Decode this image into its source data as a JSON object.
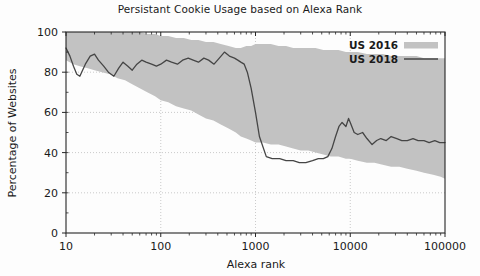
{
  "figure": {
    "width": 480,
    "height": 276,
    "background": "#fdfdfd"
  },
  "chart_data": {
    "type": "area",
    "title": "Persistant Cookie Usage based on Alexa Rank",
    "xlabel": "Alexa rank",
    "ylabel": "Percentage of Websites",
    "xscale": "log",
    "yscale": "linear",
    "xlim": [
      10,
      100000
    ],
    "ylim": [
      0,
      100
    ],
    "xticks": [
      10,
      100,
      1000,
      10000,
      100000
    ],
    "xticklabels": [
      "10",
      "100",
      "1000",
      "10000",
      "100000"
    ],
    "yticks": [
      0,
      20,
      40,
      60,
      80,
      100
    ],
    "yticklabels": [
      "0",
      "20",
      "40",
      "60",
      "80",
      "100"
    ],
    "grid": true,
    "grid_style": "dotted",
    "legend_position": "upper right",
    "colors": {
      "band_fill": "#c2c2c2",
      "line": "#454545",
      "axis": "#262626",
      "text": "#1a1a1a"
    },
    "series": [
      {
        "name": "US 2016",
        "render": "band",
        "fill": "#c2c2c2",
        "x": [
          10,
          12,
          14,
          17,
          20,
          24,
          29,
          35,
          42,
          50,
          60,
          72,
          87,
          100,
          120,
          145,
          175,
          210,
          250,
          300,
          360,
          430,
          520,
          620,
          700,
          800,
          900,
          1000,
          1200,
          1450,
          1750,
          2100,
          2500,
          3000,
          3600,
          4300,
          5200,
          6200,
          7500,
          9000,
          10000,
          12000,
          15000,
          18000,
          22000,
          27000,
          33000,
          40000,
          50000,
          60000,
          75000,
          90000,
          100000
        ],
        "y_upper": [
          100,
          100,
          100,
          100,
          100,
          100,
          100,
          100,
          100,
          100,
          100,
          99,
          99,
          98,
          98,
          97,
          97,
          96,
          96,
          95,
          95,
          94,
          93,
          92,
          92,
          93,
          93,
          94,
          94,
          94,
          93,
          93,
          92,
          92,
          92,
          92,
          91,
          91,
          91,
          90,
          90,
          90,
          89,
          89,
          89,
          88,
          88,
          88,
          88,
          87,
          87,
          87,
          87
        ],
        "y_lower": [
          86,
          84,
          83,
          82,
          81,
          80,
          79,
          77,
          76,
          74,
          72,
          70,
          68,
          66,
          65,
          63,
          62,
          61,
          59,
          57,
          56,
          54,
          52,
          50,
          48,
          47,
          46,
          45,
          45,
          44,
          44,
          43,
          42,
          41,
          41,
          40,
          39,
          38,
          38,
          37,
          37,
          36,
          35,
          35,
          34,
          33,
          33,
          32,
          31,
          30,
          29,
          28,
          27
        ]
      },
      {
        "name": "US 2018",
        "render": "line",
        "color": "#454545",
        "x": [
          10,
          11,
          12,
          13,
          14,
          16,
          18,
          20,
          22,
          25,
          28,
          32,
          36,
          40,
          45,
          50,
          56,
          63,
          70,
          80,
          90,
          100,
          115,
          130,
          150,
          170,
          195,
          220,
          250,
          285,
          320,
          365,
          415,
          470,
          530,
          600,
          650,
          700,
          760,
          820,
          900,
          1000,
          1100,
          1300,
          1500,
          1800,
          2100,
          2500,
          2900,
          3400,
          4000,
          4600,
          5200,
          5800,
          6400,
          7000,
          7600,
          8200,
          9000,
          9600,
          10000,
          11000,
          12000,
          13500,
          15000,
          17000,
          19000,
          21000,
          24000,
          27000,
          31000,
          35000,
          40000,
          46000,
          52000,
          60000,
          68000,
          78000,
          88000,
          100000
        ],
        "y": [
          92,
          88,
          83,
          79,
          78,
          84,
          88,
          89,
          86,
          83,
          80,
          78,
          82,
          85,
          83,
          81,
          84,
          86,
          85,
          84,
          83,
          84,
          86,
          85,
          84,
          86,
          87,
          86,
          85,
          87,
          86,
          84,
          87,
          90,
          88,
          87,
          86,
          85,
          84,
          80,
          72,
          60,
          48,
          38,
          37,
          37,
          36,
          36,
          35,
          35,
          36,
          37,
          37,
          38,
          42,
          48,
          53,
          55,
          53,
          57,
          55,
          50,
          49,
          50,
          47,
          44,
          46,
          47,
          46,
          48,
          47,
          46,
          46,
          47,
          46,
          46,
          45,
          46,
          45,
          45
        ]
      }
    ]
  },
  "legend": {
    "entries": [
      {
        "label": "US 2016",
        "marker": "swatch",
        "color": "#c2c2c2"
      },
      {
        "label": "US 2018",
        "marker": "line",
        "color": "#454545"
      }
    ]
  }
}
